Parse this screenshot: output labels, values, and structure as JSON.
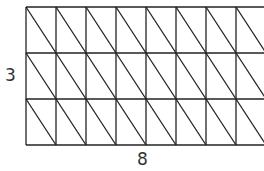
{
  "diagram": {
    "type": "triangulated-grid",
    "rows": 3,
    "columns": 8,
    "height_label": "3",
    "width_label": "8",
    "line_color": "#222222",
    "diagonal_direction": "top-left to bottom-right"
  }
}
